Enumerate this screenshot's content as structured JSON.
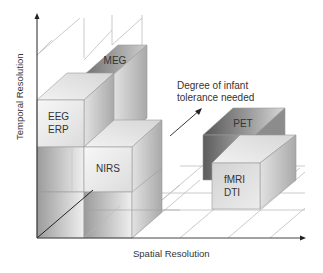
{
  "diagram": {
    "axes": {
      "y_label": "Temporal Resolution",
      "x_label": "Spatial Resolution",
      "z_label": "Degree of infant tolerance needed",
      "z_label_line1": "Degree of infant",
      "z_label_line2": "tolerance needed"
    },
    "boxes": [
      {
        "id": "meg",
        "lines": [
          "MEG"
        ]
      },
      {
        "id": "eeg-erp",
        "lines": [
          "EEG",
          "ERP"
        ]
      },
      {
        "id": "nirs",
        "lines": [
          "NIRS"
        ]
      },
      {
        "id": "pet",
        "lines": [
          "PET"
        ]
      },
      {
        "id": "fmri-dti",
        "lines": [
          "fMRI",
          "DTI"
        ]
      }
    ],
    "colors": {
      "axis": "#222222",
      "grid": "#bdbdbd",
      "text": "#333333",
      "light_face": "#efefef",
      "mid_face": "#c8c8c8",
      "dark_face": "#6e6e6e"
    }
  }
}
